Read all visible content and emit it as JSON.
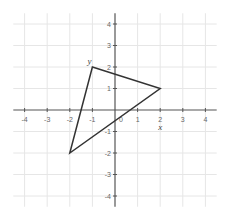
{
  "diagram": {
    "type": "coordinate-plane-triangle",
    "x_axis": {
      "min": -4,
      "max": 4,
      "ticks": [
        -4,
        -3,
        -2,
        -1,
        1,
        2,
        3,
        4
      ],
      "origin_label": "0"
    },
    "y_axis": {
      "min": -4,
      "max": 4,
      "ticks": [
        -4,
        -3,
        -2,
        -1,
        1,
        2,
        3,
        4
      ]
    },
    "grid": true,
    "triangle": {
      "vertices": [
        {
          "x": -1,
          "y": 2
        },
        {
          "x": 2,
          "y": 1
        },
        {
          "x": -2,
          "y": -2
        }
      ],
      "stroke": "#333333"
    },
    "labels": [
      {
        "text": "y",
        "near": {
          "x": -1,
          "y": 2
        }
      },
      {
        "text": "x",
        "near": {
          "x": 2,
          "y": -0.8
        }
      }
    ],
    "colors": {
      "grid": "#e6e6e6",
      "axis": "#555555",
      "tick_text": "#666666"
    }
  }
}
